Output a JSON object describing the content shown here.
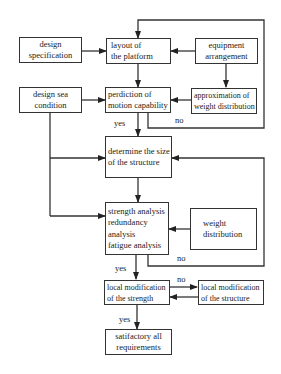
{
  "diagram": {
    "type": "flowchart",
    "nodes": {
      "design_spec": {
        "lines": [
          "design",
          "specification"
        ]
      },
      "layout": {
        "lines": [
          "layout of",
          "the platform"
        ]
      },
      "equipment": {
        "lines": [
          "equipment",
          "arrangement"
        ]
      },
      "design_sea": {
        "lines": [
          "design sea",
          "condition"
        ]
      },
      "prediction": {
        "lines": [
          "perdiction of",
          "motion capability"
        ]
      },
      "approximation": {
        "lines": [
          "approximation of",
          "weight distribution"
        ]
      },
      "determine": {
        "lines": [
          "determine the size",
          "of the structure"
        ]
      },
      "strength": {
        "lines": [
          "strength analysis",
          "redundancy",
          "analysis",
          "fatigue analysis"
        ]
      },
      "weight": {
        "lines": [
          "weight",
          "distribution"
        ]
      },
      "local_strength": {
        "lines": [
          "local modification",
          "of the strength"
        ]
      },
      "local_structure": {
        "lines": [
          "local modification",
          "of the structure"
        ]
      },
      "satisfactory": {
        "lines": [
          "satifactory all",
          "requirements"
        ]
      }
    },
    "labels": {
      "yes1": "yes",
      "no1": "no",
      "no2": "no",
      "yes2": "yes",
      "no3": "no",
      "yes3": "yes"
    },
    "edges": [
      {
        "from": "design_spec",
        "to": "layout"
      },
      {
        "from": "equipment",
        "to": "layout"
      },
      {
        "from": "equipment",
        "to": "approximation"
      },
      {
        "from": "layout",
        "to": "prediction"
      },
      {
        "from": "design_sea",
        "to": "prediction"
      },
      {
        "from": "approximation",
        "to": "prediction"
      },
      {
        "from": "prediction",
        "to": "determine",
        "label": "yes"
      },
      {
        "from": "prediction",
        "to": "layout",
        "label": "no"
      },
      {
        "from": "design_sea",
        "to": "determine"
      },
      {
        "from": "design_sea",
        "to": "strength"
      },
      {
        "from": "determine",
        "to": "strength"
      },
      {
        "from": "weight",
        "to": "strength"
      },
      {
        "from": "strength",
        "to": "determine",
        "label": "no"
      },
      {
        "from": "strength",
        "to": "local_strength",
        "label": "yes"
      },
      {
        "from": "local_strength",
        "to": "local_structure",
        "label": "no"
      },
      {
        "from": "local_structure",
        "to": "local_strength"
      },
      {
        "from": "local_strength",
        "to": "satisfactory",
        "label": "yes"
      }
    ]
  }
}
